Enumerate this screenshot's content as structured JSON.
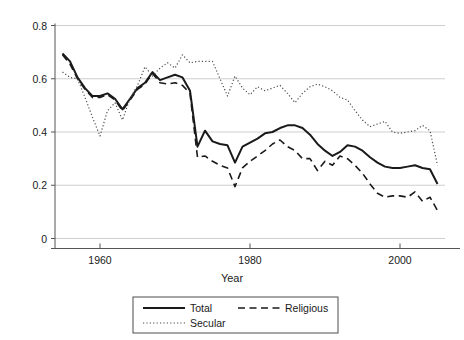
{
  "chart_data": {
    "type": "line",
    "title": "",
    "xlabel": "Year",
    "ylabel": "",
    "xlim": [
      1954,
      2006
    ],
    "ylim": [
      0,
      0.8
    ],
    "grid": true,
    "grid_axis": "y",
    "legend_position": "bottom",
    "xticks": [
      1960,
      1980,
      2000
    ],
    "xtick_labels": [
      "1960",
      "1980",
      "2000"
    ],
    "yticks": [
      0,
      0.2,
      0.4,
      0.6,
      0.8
    ],
    "ytick_labels": [
      "0",
      "0.2",
      "0.4",
      "0.6",
      "0.8"
    ],
    "x": [
      1955,
      1956,
      1957,
      1958,
      1959,
      1960,
      1961,
      1962,
      1963,
      1964,
      1965,
      1966,
      1967,
      1968,
      1969,
      1970,
      1971,
      1972,
      1973,
      1974,
      1975,
      1976,
      1977,
      1978,
      1979,
      1980,
      1981,
      1982,
      1983,
      1984,
      1985,
      1986,
      1987,
      1988,
      1989,
      1990,
      1991,
      1992,
      1993,
      1994,
      1995,
      1996,
      1997,
      1998,
      1999,
      2000,
      2001,
      2002,
      2003,
      2004,
      2005
    ],
    "series": [
      {
        "name": "Total",
        "style": "solid",
        "color": "#1a1a1a",
        "values": [
          0.695,
          0.665,
          0.605,
          0.565,
          0.535,
          0.535,
          0.545,
          0.525,
          0.485,
          0.525,
          0.565,
          0.585,
          0.625,
          0.595,
          0.605,
          0.615,
          0.605,
          0.555,
          0.345,
          0.405,
          0.365,
          0.355,
          0.35,
          0.285,
          0.345,
          0.36,
          0.375,
          0.395,
          0.4,
          0.415,
          0.425,
          0.425,
          0.415,
          0.39,
          0.355,
          0.33,
          0.31,
          0.325,
          0.35,
          0.345,
          0.33,
          0.305,
          0.285,
          0.27,
          0.265,
          0.265,
          0.27,
          0.275,
          0.265,
          0.26,
          0.205
        ]
      },
      {
        "name": "Religious",
        "style": "dashed",
        "color": "#1a1a1a",
        "values": [
          0.69,
          0.655,
          0.6,
          0.56,
          0.53,
          0.53,
          0.54,
          0.52,
          0.48,
          0.52,
          0.56,
          0.58,
          0.62,
          0.585,
          0.58,
          0.585,
          0.575,
          0.545,
          0.305,
          0.31,
          0.29,
          0.275,
          0.265,
          0.195,
          0.265,
          0.29,
          0.31,
          0.33,
          0.355,
          0.37,
          0.345,
          0.33,
          0.3,
          0.3,
          0.255,
          0.29,
          0.275,
          0.31,
          0.3,
          0.275,
          0.245,
          0.205,
          0.17,
          0.155,
          0.16,
          0.16,
          0.155,
          0.175,
          0.14,
          0.155,
          0.105
        ]
      },
      {
        "name": "Secular",
        "style": "dotted",
        "color": "#4d4d4d",
        "values": [
          0.625,
          0.605,
          0.6,
          0.53,
          0.455,
          0.385,
          0.48,
          0.51,
          0.445,
          0.525,
          0.575,
          0.645,
          0.61,
          0.64,
          0.66,
          0.64,
          0.69,
          0.66,
          0.665,
          0.665,
          0.665,
          0.6,
          0.535,
          0.61,
          0.565,
          0.54,
          0.57,
          0.555,
          0.565,
          0.575,
          0.545,
          0.51,
          0.545,
          0.57,
          0.58,
          0.57,
          0.555,
          0.53,
          0.52,
          0.48,
          0.445,
          0.42,
          0.43,
          0.44,
          0.4,
          0.395,
          0.4,
          0.405,
          0.425,
          0.405,
          0.275
        ]
      }
    ],
    "legend": [
      {
        "label": "Total",
        "style": "solid"
      },
      {
        "label": "Religious",
        "style": "dashed"
      },
      {
        "label": "Secular",
        "style": "dotted"
      }
    ]
  }
}
